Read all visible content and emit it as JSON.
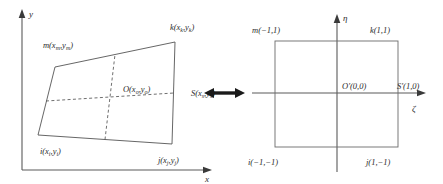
{
  "figure": {
    "arrow_symbol": "↔",
    "left_panel": {
      "name": "physical-element",
      "axes": {
        "x_label": "x",
        "y_label": "y"
      },
      "nodes": [
        {
          "id": "m",
          "label": "m(x",
          "sub1": "m",
          "mid": ",y",
          "sub2": "m",
          "close": ")"
        },
        {
          "id": "k",
          "label": "k(x",
          "sub1": "k",
          "mid": ",y",
          "sub2": "k",
          "close": ")"
        },
        {
          "id": "i",
          "label": "i(x",
          "sub1": "i",
          "mid": ",y",
          "sub2": "i",
          "close": ")"
        },
        {
          "id": "j",
          "label": "j(x",
          "sub1": "j",
          "mid": ",y",
          "sub2": "j",
          "close": ")"
        },
        {
          "id": "O",
          "label": "O(x",
          "sub1": "o",
          "mid": ",y",
          "sub2": "o",
          "close": ")"
        },
        {
          "id": "S",
          "label": "S(x",
          "sub1": "s",
          "mid": ",y",
          "sub2": "s",
          "close": ")"
        }
      ]
    },
    "right_panel": {
      "name": "parent-element",
      "axes": {
        "xi_label": "ζ",
        "eta_label": "η"
      },
      "nodes": [
        {
          "id": "m-prime",
          "label": "m(−1,1)"
        },
        {
          "id": "k-prime",
          "label": "k(1,1)"
        },
        {
          "id": "i-prime",
          "label": "i(−1,−1)"
        },
        {
          "id": "j-prime",
          "label": "j(1,−1)"
        },
        {
          "id": "O-prime",
          "label": "O′(0,0)"
        },
        {
          "id": "S-prime",
          "label": "S′(1,0)"
        }
      ]
    },
    "colors": {
      "stroke": "#4a4a4a",
      "axis": "#5a5a5a",
      "text": "#2b2b2b",
      "arrow": "#1a1a1a"
    }
  }
}
